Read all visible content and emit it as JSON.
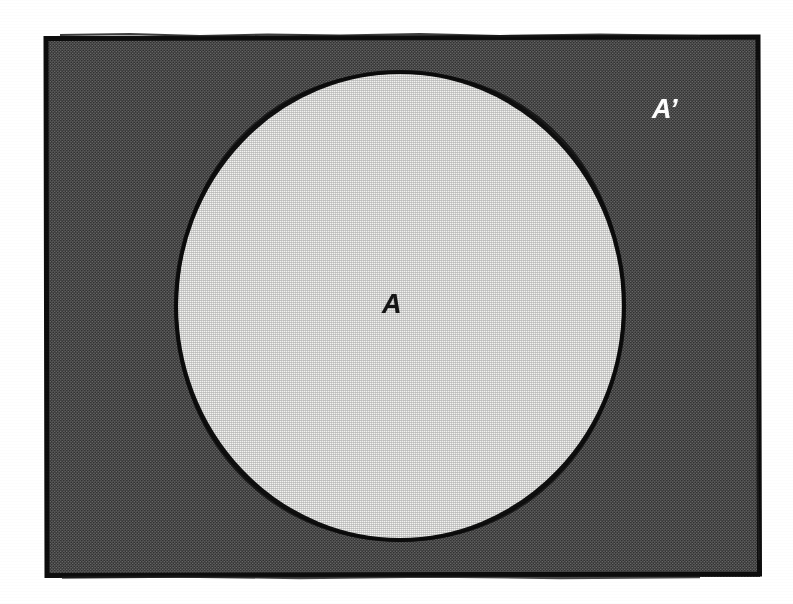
{
  "figure": {
    "kind": "venn-complement-diagram",
    "labels": {
      "set": "A",
      "complement": "A’"
    },
    "colors": {
      "page_background": "#ffffff",
      "universe_fill": "#585858",
      "universe_border": "#0d0d0d",
      "set_fill": "#f3f3f1",
      "set_border": "#101010",
      "set_label_color": "#151515",
      "complement_label_color": "#fdfdfd"
    },
    "geometry": {
      "rectangle": {
        "x": 45,
        "y": 36,
        "width": 715,
        "height": 541,
        "border_width": 5
      },
      "circle": {
        "cx": 400,
        "cy": 306,
        "rx": 224,
        "ry": 234,
        "border_width": 4
      },
      "set_label_position": {
        "x": 398,
        "y": 305
      },
      "complement_label_position": {
        "x": 668,
        "y": 110
      }
    }
  }
}
